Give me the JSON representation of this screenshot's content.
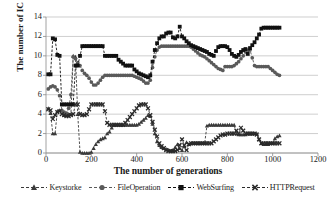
{
  "chart_data": {
    "type": "line",
    "title": "",
    "xlabel": "The number of generations",
    "ylabel": "The number of IC",
    "xlim": [
      0,
      1200
    ],
    "ylim": [
      0,
      14
    ],
    "xticks": [
      0,
      200,
      400,
      600,
      800,
      1000,
      1200
    ],
    "yticks": [
      0,
      2,
      4,
      6,
      8,
      10,
      12,
      14
    ],
    "grid": "horizontal",
    "legend_position": "bottom",
    "marker_styles": {
      "Keystorke": "triangle",
      "FileOperation": "circle",
      "WebSurfing": "square",
      "HTTPRequest": "cross-x"
    },
    "line_style": "dashed",
    "colors": {
      "Keystorke": "#3a3a3a",
      "FileOperation": "#5a5a5a",
      "WebSurfing": "#111111",
      "HTTPRequest": "#2a2a2a",
      "grid": "#b9b9b9",
      "axis": "#8a8a8a",
      "text": "#1a1a1a"
    },
    "series": [
      {
        "name": "Keystorke",
        "x": [
          10,
          20,
          30,
          40,
          50,
          60,
          70,
          80,
          90,
          100,
          110,
          120,
          130,
          140,
          150,
          160,
          170,
          180,
          190,
          200,
          210,
          220,
          230,
          240,
          250,
          260,
          270,
          280,
          290,
          300,
          310,
          320,
          330,
          340,
          350,
          360,
          370,
          380,
          390,
          400,
          410,
          420,
          430,
          440,
          450,
          460,
          470,
          480,
          490,
          500,
          510,
          520,
          530,
          540,
          550,
          560,
          570,
          580,
          590,
          600,
          610,
          620,
          630,
          640,
          650,
          660,
          670,
          680,
          690,
          700,
          710,
          720,
          730,
          740,
          750,
          760,
          770,
          780,
          790,
          800,
          810,
          820,
          830,
          840,
          850,
          860,
          870,
          880,
          890,
          900,
          910,
          920,
          930,
          940,
          950,
          960,
          970,
          980,
          990,
          1000,
          1010,
          1020,
          1030
        ],
        "values": [
          4.6,
          4.1,
          2.0,
          2.0,
          4.3,
          4.4,
          4.4,
          3.9,
          3.9,
          4.0,
          4.0,
          10.0,
          9.9,
          4.0,
          0.1,
          0.0,
          0.0,
          0.0,
          0.0,
          0.1,
          0.5,
          0.9,
          1.2,
          1.4,
          1.5,
          1.6,
          2.0,
          2.2,
          2.6,
          2.9,
          2.9,
          2.9,
          2.9,
          2.9,
          2.9,
          2.9,
          2.9,
          2.9,
          2.9,
          2.9,
          3.0,
          3.2,
          3.4,
          3.6,
          3.9,
          3.8,
          3.0,
          2.0,
          1.2,
          0.8,
          0.6,
          0.5,
          0.4,
          0.3,
          0.2,
          0.3,
          0.6,
          0.9,
          0.5,
          0.3,
          0.7,
          1.1,
          0.9,
          1.0,
          1.0,
          1.0,
          1.0,
          1.0,
          1.0,
          1.0,
          2.8,
          2.9,
          2.9,
          2.9,
          2.9,
          2.9,
          2.9,
          2.9,
          2.9,
          2.9,
          2.9,
          2.9,
          2.9,
          2.0,
          1.9,
          1.9,
          1.9,
          1.9,
          2.0,
          2.0,
          2.0,
          2.0,
          2.0,
          1.4,
          1.0,
          0.9,
          0.9,
          0.9,
          1.0,
          1.0,
          1.5,
          1.7,
          1.8
        ]
      },
      {
        "name": "FileOperation",
        "x": [
          10,
          20,
          30,
          40,
          50,
          60,
          70,
          80,
          90,
          100,
          110,
          120,
          130,
          140,
          150,
          160,
          170,
          180,
          190,
          200,
          210,
          220,
          230,
          240,
          250,
          260,
          270,
          280,
          290,
          300,
          310,
          320,
          330,
          340,
          350,
          360,
          370,
          380,
          390,
          400,
          410,
          420,
          430,
          440,
          450,
          460,
          470,
          480,
          490,
          500,
          510,
          520,
          530,
          540,
          550,
          560,
          570,
          580,
          590,
          600,
          610,
          620,
          630,
          640,
          650,
          660,
          670,
          680,
          690,
          700,
          710,
          720,
          730,
          740,
          750,
          760,
          770,
          780,
          790,
          800,
          810,
          820,
          830,
          840,
          850,
          860,
          870,
          880,
          890,
          900,
          910,
          920,
          930,
          940,
          950,
          960,
          970,
          980,
          990,
          1000,
          1010,
          1020,
          1030
        ],
        "values": [
          6.6,
          6.8,
          6.9,
          6.8,
          6.5,
          5.9,
          4.4,
          4.2,
          4.1,
          4.6,
          6.0,
          9.9,
          9.7,
          9.3,
          9.0,
          8.5,
          8.2,
          8.0,
          7.7,
          7.3,
          7.0,
          7.0,
          7.2,
          7.5,
          7.8,
          8.0,
          8.0,
          8.0,
          8.0,
          8.0,
          8.0,
          8.0,
          8.0,
          8.0,
          8.0,
          8.0,
          8.0,
          8.0,
          7.9,
          7.8,
          7.7,
          7.6,
          7.4,
          7.2,
          7.2,
          7.5,
          8.8,
          9.9,
          10.6,
          10.9,
          11.0,
          11.0,
          11.0,
          11.0,
          11.0,
          11.0,
          11.0,
          11.0,
          11.0,
          11.0,
          11.0,
          11.0,
          11.0,
          10.9,
          10.7,
          10.5,
          10.3,
          10.1,
          10.0,
          9.9,
          9.7,
          9.5,
          9.3,
          9.1,
          8.9,
          8.7,
          8.6,
          8.5,
          8.9,
          8.9,
          8.9,
          8.9,
          9.0,
          9.2,
          9.4,
          9.7,
          10.0,
          10.4,
          10.6,
          10.6,
          9.8,
          9.0,
          8.9,
          8.9,
          8.9,
          8.9,
          8.9,
          8.9,
          8.7,
          8.5,
          8.3,
          8.1,
          8.0
        ]
      },
      {
        "name": "WebSurfing",
        "x": [
          10,
          20,
          30,
          40,
          50,
          60,
          70,
          80,
          90,
          100,
          110,
          120,
          130,
          140,
          150,
          160,
          170,
          180,
          190,
          200,
          210,
          220,
          230,
          240,
          250,
          260,
          270,
          280,
          290,
          300,
          310,
          320,
          330,
          340,
          350,
          360,
          370,
          380,
          390,
          400,
          410,
          420,
          430,
          440,
          450,
          460,
          470,
          480,
          490,
          500,
          510,
          520,
          530,
          540,
          550,
          560,
          570,
          580,
          590,
          600,
          610,
          620,
          630,
          640,
          650,
          660,
          670,
          680,
          690,
          700,
          710,
          720,
          730,
          740,
          750,
          760,
          770,
          780,
          790,
          800,
          810,
          820,
          830,
          840,
          850,
          860,
          870,
          880,
          890,
          900,
          910,
          920,
          930,
          940,
          950,
          960,
          970,
          980,
          990,
          1000,
          1010,
          1020,
          1030
        ],
        "values": [
          8.1,
          8.1,
          11.8,
          11.7,
          10.1,
          10.0,
          5.0,
          5.0,
          5.0,
          5.0,
          5.0,
          5.0,
          9.0,
          9.0,
          10.0,
          11.0,
          11.0,
          11.0,
          11.0,
          11.0,
          11.0,
          11.0,
          11.0,
          11.0,
          11.0,
          10.0,
          10.0,
          10.0,
          10.0,
          10.0,
          10.0,
          9.6,
          9.4,
          9.2,
          9.0,
          9.0,
          9.0,
          9.0,
          8.6,
          8.4,
          8.2,
          8.1,
          8.0,
          7.9,
          7.8,
          8.0,
          9.4,
          10.6,
          11.3,
          11.8,
          12.0,
          12.0,
          12.3,
          12.4,
          12.4,
          11.9,
          11.8,
          12.0,
          13.0,
          12.0,
          11.8,
          11.5,
          11.3,
          11.1,
          11.0,
          10.9,
          10.8,
          10.7,
          10.6,
          10.5,
          10.4,
          10.2,
          10.1,
          10.0,
          10.5,
          10.9,
          11.0,
          11.0,
          11.0,
          10.9,
          10.6,
          10.2,
          10.0,
          9.9,
          10.1,
          10.4,
          10.6,
          10.7,
          10.2,
          10.8,
          11.1,
          11.4,
          11.8,
          12.2,
          12.8,
          12.9,
          12.9,
          12.9,
          12.9,
          12.9,
          12.9,
          12.9,
          12.9
        ]
      },
      {
        "name": "HTTPRequest",
        "x": [
          10,
          20,
          30,
          40,
          50,
          60,
          70,
          80,
          90,
          100,
          110,
          120,
          130,
          140,
          150,
          160,
          170,
          180,
          190,
          200,
          210,
          220,
          230,
          240,
          250,
          260,
          270,
          280,
          290,
          300,
          310,
          320,
          330,
          340,
          350,
          360,
          370,
          380,
          390,
          400,
          410,
          420,
          430,
          440,
          450,
          460,
          470,
          480,
          490,
          500,
          510,
          520,
          530,
          540,
          550,
          560,
          570,
          580,
          590,
          600,
          610,
          620,
          630,
          640,
          650,
          660,
          670,
          680,
          690,
          700,
          710,
          720,
          730,
          740,
          750,
          760,
          770,
          780,
          790,
          800,
          810,
          820,
          830,
          840,
          850,
          860,
          870,
          880,
          890,
          900,
          910,
          920,
          930,
          940,
          950,
          960,
          970,
          980,
          990,
          1000,
          1010,
          1020,
          1030
        ],
        "values": [
          4.5,
          4.4,
          3.5,
          3.9,
          4.2,
          4.3,
          4.0,
          3.9,
          3.8,
          3.8,
          3.9,
          4.0,
          5.0,
          5.0,
          4.0,
          3.9,
          3.9,
          4.0,
          4.5,
          5.0,
          5.0,
          5.0,
          5.0,
          5.0,
          5.0,
          4.3,
          3.1,
          2.9,
          2.9,
          2.9,
          2.9,
          2.9,
          2.9,
          2.9,
          3.1,
          3.4,
          3.7,
          4.0,
          4.3,
          4.6,
          4.9,
          5.0,
          5.0,
          5.0,
          4.6,
          3.9,
          3.2,
          2.4,
          1.7,
          1.0,
          0.7,
          0.5,
          0.3,
          0.2,
          0.2,
          0.2,
          0.2,
          0.3,
          0.8,
          1.4,
          0.8,
          0.3,
          0.9,
          1.0,
          1.0,
          1.0,
          1.0,
          1.0,
          1.0,
          1.0,
          1.0,
          1.0,
          1.0,
          1.2,
          1.4,
          1.6,
          1.8,
          1.9,
          1.9,
          2.0,
          2.0,
          2.0,
          2.0,
          2.3,
          2.0,
          2.6,
          2.3,
          2.0,
          2.0,
          2.0,
          2.0,
          2.0,
          1.9,
          1.4,
          1.0,
          1.0,
          1.0,
          1.0,
          1.0,
          1.0,
          1.0,
          1.0,
          1.0
        ]
      }
    ]
  },
  "axes": {
    "ylabel": "The number of IC",
    "xlabel": "The number of generations",
    "yticks": [
      "0",
      "2",
      "4",
      "6",
      "8",
      "10",
      "12",
      "14"
    ],
    "xticks": [
      "0",
      "200",
      "400",
      "600",
      "800",
      "1000",
      "1200"
    ]
  },
  "legend": {
    "items": [
      {
        "label": "Keystorke",
        "marker": "triangle-marker-icon"
      },
      {
        "label": "FileOperation",
        "marker": "circle-marker-icon"
      },
      {
        "label": "WebSurfing",
        "marker": "square-marker-icon"
      },
      {
        "label": "HTTPRequest",
        "marker": "cross-marker-icon"
      }
    ]
  }
}
